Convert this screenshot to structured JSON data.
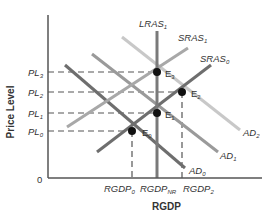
{
  "diagram": {
    "axes": {
      "y_label": "Price Level",
      "x_label": "RGDP",
      "origin_label": "0"
    },
    "y_ticks": [
      {
        "base": "PL",
        "sub": "3",
        "y": 72
      },
      {
        "base": "PL",
        "sub": "2",
        "y": 92
      },
      {
        "base": "PL",
        "sub": "1",
        "y": 113
      },
      {
        "base": "PL",
        "sub": "0",
        "y": 131
      }
    ],
    "x_ticks": [
      {
        "base": "RGDP",
        "sub": "0",
        "x": 132
      },
      {
        "base": "RGDP",
        "sub": "NR",
        "x": 157
      },
      {
        "base": "RGDP",
        "sub": "2",
        "x": 182
      }
    ],
    "curves": {
      "lras": {
        "base": "LRAS",
        "sub": "1",
        "color": "#7a7a7a"
      },
      "sras1": {
        "base": "SRAS",
        "sub": "1",
        "color": "#a8a8a8"
      },
      "sras0": {
        "base": "SRAS",
        "sub": "0",
        "color": "#6e6e6e"
      },
      "ad0": {
        "base": "AD",
        "sub": "0",
        "color": "#6e6e6e"
      },
      "ad1": {
        "base": "AD",
        "sub": "1",
        "color": "#9a9a9a"
      },
      "ad2": {
        "base": "AD",
        "sub": "2",
        "color": "#c8c8c8"
      }
    },
    "equilibria": [
      {
        "base": "E",
        "sub": "0",
        "x": 132,
        "y": 131
      },
      {
        "base": "E",
        "sub": "1",
        "x": 157,
        "y": 113
      },
      {
        "base": "E",
        "sub": "2",
        "x": 182,
        "y": 92
      },
      {
        "base": "E",
        "sub": "3",
        "x": 157,
        "y": 72
      }
    ],
    "colors": {
      "axis": "#555555",
      "dash": "#555555",
      "point": "#111111"
    }
  }
}
